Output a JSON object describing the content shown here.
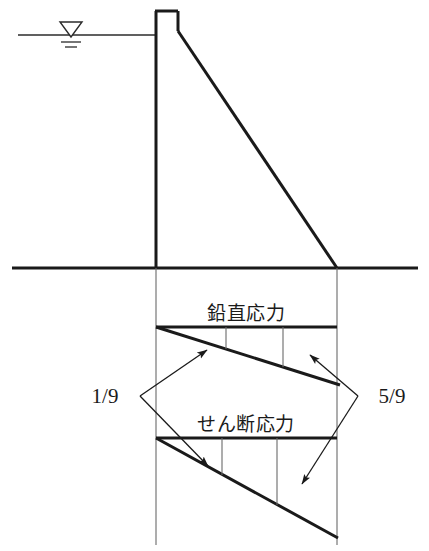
{
  "figure": {
    "background_color": "#ffffff",
    "line_color": "#1a1a1a",
    "thin_line_color": "#555555",
    "width": 429,
    "height": 551
  },
  "labels": {
    "vertical_stress": "鉛直応力",
    "shear_stress": "せん断応力",
    "left_fraction": "1/9",
    "right_fraction": "5/9"
  },
  "icons": {
    "water_level": "water-level-triangle-icon",
    "arrow_head": "arrow-head-icon"
  },
  "geometry": {
    "ground_line": {
      "x1": 12,
      "y1": 268,
      "x2": 418,
      "y2": 268
    },
    "water_line": {
      "x1": 18,
      "y1": 35,
      "x2": 156,
      "y2": 35
    },
    "water_symbol": {
      "cx": 71,
      "cy": 28,
      "half_width": 11,
      "height": 14
    },
    "dam": {
      "crest_left_x": 156,
      "crest_right_x": 178,
      "crest_top_y": 11,
      "crest_drop_y": 31,
      "heel_y": 268,
      "toe_x": 337,
      "toe_y": 268
    },
    "base_extension": {
      "left_x": 156,
      "right_x": 337,
      "bottom_y": 545
    },
    "vertical_stress_block": {
      "top_y": 327,
      "left_x": 156,
      "right_x": 337,
      "slope_end_x": 340,
      "slope_end_y": 385,
      "dividers_x": [
        226,
        283
      ]
    },
    "shear_stress_block": {
      "top_y": 438,
      "left_x": 156,
      "right_x": 337,
      "apex_x": 337,
      "apex_y": 538,
      "dividers_x": [
        222,
        277
      ]
    },
    "leaders": {
      "left_label_point": {
        "x": 140,
        "y": 396
      },
      "left_arrow_upper": {
        "x": 207,
        "y": 350
      },
      "left_arrow_lower": {
        "x": 208,
        "y": 466
      },
      "right_label_point": {
        "x": 358,
        "y": 396
      },
      "right_arrow_upper": {
        "x": 310,
        "y": 355
      },
      "right_arrow_lower": {
        "x": 302,
        "y": 484
      }
    },
    "text_positions": {
      "vertical_stress": {
        "x": 246,
        "y": 320
      },
      "shear_stress": {
        "x": 246,
        "y": 431
      },
      "left_fraction": {
        "x": 105,
        "y": 403
      },
      "right_fraction": {
        "x": 392,
        "y": 403
      }
    }
  }
}
